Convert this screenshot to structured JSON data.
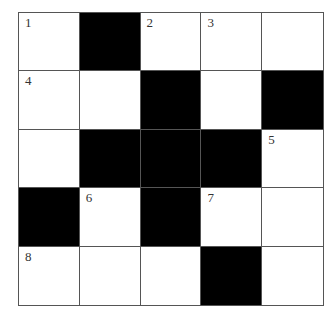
{
  "puzzle": {
    "rows": 5,
    "cols": 5,
    "cells": [
      [
        {
          "black": false,
          "num": "1"
        },
        {
          "black": true,
          "num": ""
        },
        {
          "black": false,
          "num": "2"
        },
        {
          "black": false,
          "num": "3"
        },
        {
          "black": false,
          "num": ""
        }
      ],
      [
        {
          "black": false,
          "num": "4"
        },
        {
          "black": false,
          "num": ""
        },
        {
          "black": true,
          "num": ""
        },
        {
          "black": false,
          "num": ""
        },
        {
          "black": true,
          "num": ""
        }
      ],
      [
        {
          "black": false,
          "num": ""
        },
        {
          "black": true,
          "num": ""
        },
        {
          "black": true,
          "num": ""
        },
        {
          "black": true,
          "num": ""
        },
        {
          "black": false,
          "num": "5"
        }
      ],
      [
        {
          "black": true,
          "num": ""
        },
        {
          "black": false,
          "num": "6"
        },
        {
          "black": true,
          "num": ""
        },
        {
          "black": false,
          "num": "7"
        },
        {
          "black": false,
          "num": ""
        }
      ],
      [
        {
          "black": false,
          "num": "8"
        },
        {
          "black": false,
          "num": ""
        },
        {
          "black": false,
          "num": ""
        },
        {
          "black": true,
          "num": ""
        },
        {
          "black": false,
          "num": ""
        }
      ]
    ]
  },
  "colors": {
    "black_cell": "#000000",
    "white_cell": "#ffffff",
    "grid_line": "#555555"
  }
}
